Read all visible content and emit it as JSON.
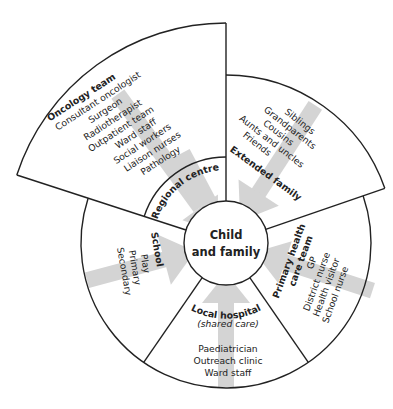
{
  "colors": {
    "stroke": "#222222",
    "arrow": "#d4d4d4",
    "background": "#ffffff"
  },
  "center": {
    "line1": "Child",
    "line2": "and family"
  },
  "sectors": {
    "oncology": {
      "title": "Oncology team",
      "items": [
        "Consultant oncologist",
        "Surgeon",
        "Radiotherapist",
        "Outpatient team",
        "Ward staff",
        "Social workers",
        "Liaison nurses",
        "Pathology"
      ]
    },
    "regional": {
      "title": "Regional centre"
    },
    "extended": {
      "title": "Extended family",
      "items": [
        "Siblings",
        "Grandparents",
        "Cousins",
        "Aunts and uncles",
        "Friends"
      ]
    },
    "primary": {
      "title_line1": "Primary health",
      "title_line2": "care team",
      "items": [
        "GP",
        "District nurse",
        "Health visitor",
        "School nurse"
      ]
    },
    "local": {
      "title": "Local hospital",
      "subtitle": "(shared care)",
      "items": [
        "Paediatrician",
        "Outreach clinic",
        "Ward staff"
      ]
    },
    "school": {
      "title": "School",
      "items": [
        "Play",
        "Primary",
        "Secondary"
      ]
    }
  }
}
